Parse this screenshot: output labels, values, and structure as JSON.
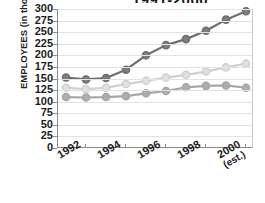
{
  "chart_data": {
    "type": "line",
    "title": "1991-2000",
    "xlabel": "",
    "ylabel": "EMPLOYEES  (in thousands)",
    "x": [
      1991,
      1992,
      1993,
      1994,
      1995,
      1996,
      1997,
      1998,
      1999,
      2000
    ],
    "xtick_labels": [
      "1992",
      "1994",
      "1996",
      "1998",
      "2000"
    ],
    "xtick_sublabel": "(est.)",
    "xtick_values": [
      1992,
      1994,
      1996,
      1998,
      2000
    ],
    "ytick_labels": [
      "300",
      "275",
      "250",
      "225",
      "200",
      "175",
      "150",
      "125",
      "100",
      "75",
      "50",
      "25",
      "0"
    ],
    "ylim": [
      0,
      300
    ],
    "ytick_step": 25,
    "grid": true,
    "legend": "none",
    "series": [
      {
        "name": "series-dark",
        "color": "#6e6e6e",
        "marker_fill": "#7d7d7d",
        "values": [
          152,
          148,
          151,
          169,
          200,
          222,
          235,
          253,
          277,
          295
        ]
      },
      {
        "name": "series-light",
        "color": "#cfcfcf",
        "marker_fill": "#e0e0e0",
        "values": [
          130,
          127,
          130,
          138,
          145,
          152,
          158,
          165,
          174,
          182
        ]
      },
      {
        "name": "series-medium",
        "color": "#a6a6a6",
        "marker_fill": "#adadad",
        "values": [
          110,
          109,
          110,
          112,
          118,
          123,
          131,
          134,
          135,
          130
        ]
      }
    ]
  }
}
